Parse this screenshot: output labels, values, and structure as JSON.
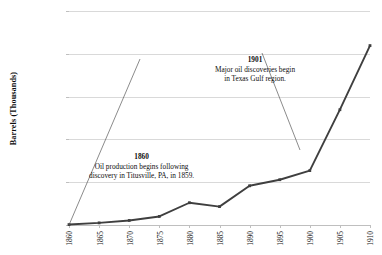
{
  "chart_data": {
    "type": "line",
    "title": "",
    "xlabel": "",
    "ylabel": "Barrels (Thousands)",
    "categories": [
      "1860",
      "1865",
      "1870",
      "1875",
      "1880",
      "1885",
      "1890",
      "1895",
      "1900",
      "1905",
      "1910"
    ],
    "values": [
      500,
      2500,
      5300,
      10000,
      26000,
      21500,
      45800,
      52900,
      63600,
      134700,
      209600
    ],
    "series": [
      {
        "name": "Oil production",
        "values": [
          500,
          2500,
          5300,
          10000,
          26000,
          21500,
          45800,
          52900,
          63600,
          134700,
          209600
        ]
      }
    ],
    "ylim": [
      0,
      250000
    ],
    "ytick_values": [
      0,
      50000,
      100000,
      150000,
      200000,
      250000
    ],
    "ytick_labels": [
      "0",
      "50,000",
      "100,000",
      "150,000",
      "200,000",
      "250,000"
    ],
    "grid": true,
    "legend": "none",
    "line_color": "#3f3f3f",
    "marker_color": "#3f3f3f",
    "gridline_color": "#d9d9d9",
    "annotations": [
      {
        "id": "annotation-1860",
        "year": "1860",
        "lines": [
          "Oil production begins following",
          "discovery in Titusville, PA, in 1859."
        ],
        "target_category": "1860"
      },
      {
        "id": "annotation-1901",
        "year": "1901",
        "lines": [
          "Major oil discoveries begin",
          "in Texas Gulf region."
        ],
        "target_category": "1900"
      }
    ]
  }
}
